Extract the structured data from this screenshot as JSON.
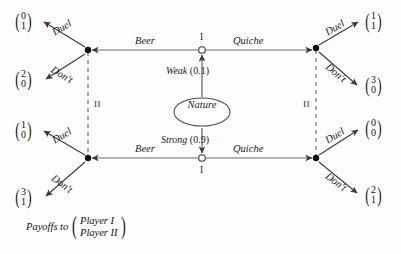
{
  "figure": {
    "nature": {
      "node_label": "Nature",
      "branches": [
        {
          "name": "weak",
          "label": "Weak",
          "probability": "(0.1)"
        },
        {
          "name": "strong",
          "label": "Strong",
          "probability": "(0.9)"
        }
      ]
    },
    "player_marks": {
      "sender_top": "I",
      "sender_bottom": "I",
      "receiver_left": "II",
      "receiver_right": "II"
    },
    "moves": {
      "beer": "Beer",
      "quiche": "Quiche",
      "duel": "Duel",
      "dont": "Don't"
    },
    "branches": [
      {
        "name": "top-left-duel",
        "label": "Duel",
        "payoff": [
          "0",
          "1"
        ]
      },
      {
        "name": "top-left-dont",
        "label": "Don't",
        "payoff": [
          "2",
          "0"
        ]
      },
      {
        "name": "top-right-duel",
        "label": "Duel",
        "payoff": [
          "1",
          "1"
        ]
      },
      {
        "name": "top-right-dont",
        "label": "Don't",
        "payoff": [
          "3",
          "0"
        ]
      },
      {
        "name": "bottom-left-duel",
        "label": "Duel",
        "payoff": [
          "1",
          "0"
        ]
      },
      {
        "name": "bottom-left-dont",
        "label": "Don't",
        "payoff": [
          "3",
          "1"
        ]
      },
      {
        "name": "bottom-right-duel",
        "label": "Duel",
        "payoff": [
          "0",
          "0"
        ]
      },
      {
        "name": "bottom-right-dont",
        "label": "Don't",
        "payoff": [
          "2",
          "1"
        ]
      }
    ],
    "legend": {
      "text": "Payoffs to",
      "player_one": "Player I",
      "player_two": "Player II"
    },
    "colors": {
      "line": "#4d4d4d",
      "node_fill": "#111111",
      "text": "#111111",
      "background": "#fdfdfd"
    }
  }
}
